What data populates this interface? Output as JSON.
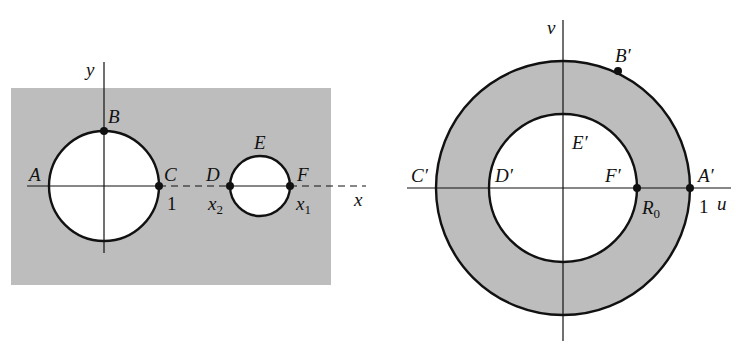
{
  "colors": {
    "shade": "#bdbdbd",
    "ink": "#111111",
    "background": "#ffffff",
    "hole": "#ffffff"
  },
  "left_panel": {
    "axis_labels": {
      "x": "x",
      "y": "y"
    },
    "points": {
      "A": "A",
      "B": "B",
      "C": "C",
      "D": "D",
      "E": "E",
      "F": "F"
    },
    "tick_labels": {
      "one": "1",
      "x2_base": "x",
      "x2_sub": "2",
      "x1_base": "x",
      "x1_sub": "1"
    }
  },
  "right_panel": {
    "axis_labels": {
      "u": "u",
      "v": "v"
    },
    "points": {
      "A_prime": "A′",
      "B_prime": "B′",
      "C_prime": "C′",
      "D_prime": "D′",
      "E_prime": "E′",
      "F_prime": "F′"
    },
    "tick_labels": {
      "one": "1",
      "R0_base": "R",
      "R0_sub": "0"
    }
  }
}
